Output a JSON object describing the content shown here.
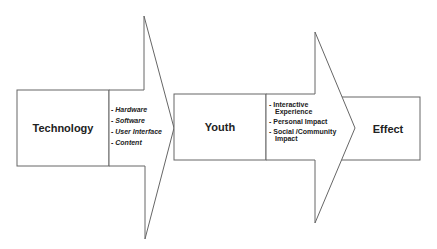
{
  "diagram": {
    "nodes": [
      {
        "id": "technology",
        "label": "Technology"
      },
      {
        "id": "youth",
        "label": "Youth"
      },
      {
        "id": "effect",
        "label": "Effect"
      }
    ],
    "arrows": [
      {
        "from": "technology",
        "to": "youth",
        "items": [
          "- Hardware",
          "- Software",
          "- User Interface",
          "- Content"
        ]
      },
      {
        "from": "youth",
        "to": "effect",
        "items": [
          {
            "line1": "- Interactive",
            "line2": "Experience"
          },
          {
            "line1": "- Personal Impact",
            "line2": ""
          },
          {
            "line1": "- Social /Community",
            "line2": "Impact"
          }
        ]
      }
    ]
  }
}
